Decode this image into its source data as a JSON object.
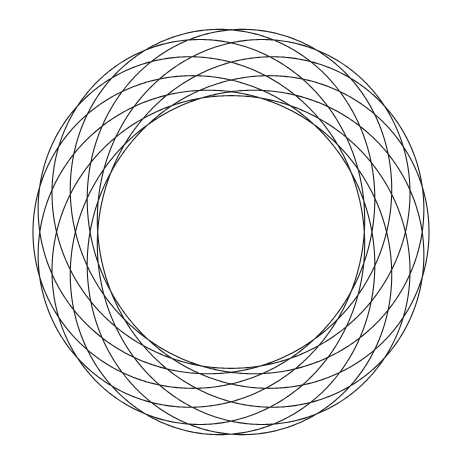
{
  "figure": {
    "title": "",
    "type": "spirograph",
    "stroke_color": "#1e1e1e",
    "background_color": "#ffffff",
    "center": [
      231,
      232
    ],
    "outer_radius_x": 198,
    "outer_radius_y": 204,
    "inner_radius": 133,
    "params": {
      "a": 166,
      "b": 33,
      "p": 11,
      "q": 3,
      "samples": 6000
    }
  }
}
